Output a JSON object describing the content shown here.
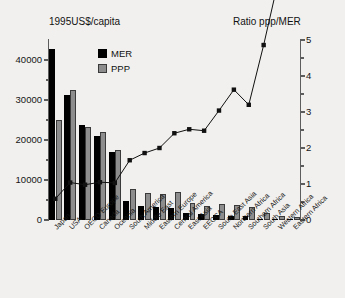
{
  "chart_data": {
    "type": "bar",
    "title": "",
    "left_axis_title": "1995US$/capita",
    "right_axis_title": "Ratio ppp/MER",
    "xlabel": "",
    "ylabel": "1995US$/capita",
    "ylim": [
      0,
      45000
    ],
    "y2lim": [
      0,
      5
    ],
    "ytick_labels": [
      "0",
      "10000",
      "20000",
      "30000",
      "40000"
    ],
    "ytick_values": [
      0,
      10000,
      20000,
      30000,
      40000
    ],
    "y2tick_labels": [
      "0",
      "1",
      "2",
      "3",
      "4",
      "5"
    ],
    "y2tick_values": [
      0,
      1,
      2,
      3,
      4,
      5
    ],
    "grid": false,
    "legend_position": "top-center",
    "categories": [
      "Japan",
      "USA",
      "OECD Europe",
      "Canada",
      "Oceania",
      "South America",
      "Middle East",
      "Eastern Europe",
      "Central America",
      "East Asia",
      "EECCA",
      "South East Asia",
      "Northern Africa",
      "Southern Africa",
      "South Asia",
      "Western Africa",
      "Eastern Africa"
    ],
    "series": [
      {
        "name": "MER",
        "type": "bar",
        "color": "#000000",
        "values": [
          42800,
          31300,
          23700,
          21000,
          17100,
          4700,
          3600,
          3300,
          2900,
          1700,
          1450,
          1350,
          1050,
          1000,
          350,
          150,
          100
        ]
      },
      {
        "name": "PPP",
        "type": "bar",
        "color": "#8d8d8d",
        "values": [
          25100,
          32500,
          23300,
          22100,
          17600,
          7800,
          6700,
          6600,
          7000,
          4300,
          3600,
          4100,
          3800,
          3200,
          1700,
          1000,
          850
        ]
      },
      {
        "name": "Ratio ppp/MER",
        "type": "line",
        "axis": "right",
        "color": "#111111",
        "values": [
          0.59,
          1.04,
          0.98,
          1.05,
          1.03,
          1.66,
          1.86,
          2.0,
          2.41,
          2.52,
          2.48,
          3.04,
          3.62,
          3.2,
          4.86,
          6.67,
          8.5
        ]
      }
    ]
  },
  "legend": {
    "items": [
      {
        "label": "MER",
        "color": "#000000"
      },
      {
        "label": "PPP",
        "color": "#8d8d8d"
      }
    ]
  }
}
